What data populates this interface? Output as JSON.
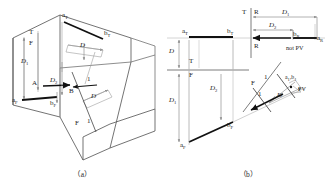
{
  "figure": {
    "title_implicit": "Auxiliary view construction of an oblique line",
    "captions": {
      "a": "（a）",
      "b": "（b）"
    }
  },
  "colors": {
    "solid_outline": "#5a5a5a",
    "thin_construction": "#9a9a9a",
    "heavy_line": "#111111",
    "fold_line": "#6e6e6e",
    "dim_arrow": "#8a8a8a",
    "text": "#1c1c1c"
  },
  "fig_a": {
    "caption": "（a）",
    "description": "Isometric pictorial of a wedge block showing point A and B, the top (T), front (F) and auxiliary (1) viewing directions with transfer distances D, D1 and D2.",
    "labels": [
      {
        "name": "a-top",
        "text": "a",
        "sub": "T",
        "italic": false,
        "x": 62,
        "y": 16
      },
      {
        "name": "b-top",
        "text": "b",
        "sub": "T",
        "italic": false,
        "x": 104,
        "y": 33
      },
      {
        "name": "a-front",
        "text": "a",
        "sub": "F",
        "italic": false,
        "x": 14,
        "y": 97
      },
      {
        "name": "b-front",
        "text": "b",
        "sub": "F",
        "italic": false,
        "x": 51,
        "y": 99
      },
      {
        "name": "point-A",
        "text": "A",
        "sub": "",
        "italic": false,
        "x": 35,
        "y": 81
      },
      {
        "name": "point-B",
        "text": "B",
        "sub": "",
        "italic": false,
        "x": 71,
        "y": 90
      },
      {
        "name": "view-T",
        "text": "T",
        "sub": "",
        "italic": false,
        "x": 30,
        "y": 32
      },
      {
        "name": "view-F-top",
        "text": "F",
        "sub": "",
        "italic": false,
        "x": 30,
        "y": 43
      },
      {
        "name": "view-F-low",
        "text": "F",
        "sub": "",
        "italic": false,
        "x": 77,
        "y": 122
      },
      {
        "name": "view-1-low",
        "text": "1",
        "sub": "",
        "italic": false,
        "x": 89,
        "y": 122
      },
      {
        "name": "view-1-top",
        "text": "1",
        "sub": "",
        "italic": false,
        "x": 88,
        "y": 78
      },
      {
        "name": "dist-D1",
        "text": "D",
        "sub": "1",
        "italic": true,
        "x": 24,
        "y": 62
      },
      {
        "name": "dist-D2",
        "text": "D",
        "sub": "2",
        "italic": true,
        "x": 53,
        "y": 80
      },
      {
        "name": "dist-D-top",
        "text": "D",
        "sub": "",
        "italic": true,
        "x": 72,
        "y": 48
      },
      {
        "name": "dist-D-aux",
        "text": "D",
        "sub": "",
        "italic": true,
        "x": 92,
        "y": 94
      }
    ]
  },
  "fig_b": {
    "caption": "（b）",
    "description": "Three-view orthographic layout: top view (T), front view (F), right-side view (R) and auxiliary view 1, with point A and B projected; distances D, D1 and D2 transferred.",
    "labels": [
      {
        "name": "fold-T-upper",
        "text": "T",
        "sub": "",
        "italic": false,
        "x": 80,
        "y": 12
      },
      {
        "name": "fold-R-upper",
        "text": "R",
        "sub": "",
        "italic": false,
        "x": 89,
        "y": 12
      },
      {
        "name": "fold-R-lower",
        "text": "R",
        "sub": "",
        "italic": false,
        "x": 89,
        "y": 44
      },
      {
        "name": "dist-D1-top",
        "text": "D",
        "sub": "1",
        "italic": true,
        "x": 122,
        "y": 14
      },
      {
        "name": "dist-D2-top",
        "text": "D",
        "sub": "2",
        "italic": true,
        "x": 110,
        "y": 27
      },
      {
        "name": "b-right",
        "text": "b",
        "sub": "R",
        "italic": false,
        "x": 128,
        "y": 33
      },
      {
        "name": "a-right",
        "text": "a",
        "sub": "R",
        "italic": false,
        "x": 152,
        "y": 37
      },
      {
        "name": "not-pv",
        "text": "not PV",
        "sub": "",
        "italic": false,
        "x": 123,
        "y": 47
      },
      {
        "name": "a-top",
        "text": "a",
        "sub": "T",
        "italic": false,
        "x": 17,
        "y": 31
      },
      {
        "name": "b-top",
        "text": "b",
        "sub": "T",
        "italic": false,
        "x": 62,
        "y": 31
      },
      {
        "name": "dist-D-left",
        "text": "D",
        "sub": "",
        "italic": true,
        "x": 5,
        "y": 55
      },
      {
        "name": "fold-T-left",
        "text": "T",
        "sub": "",
        "italic": false,
        "x": 25,
        "y": 62
      },
      {
        "name": "fold-F-left",
        "text": "F",
        "sub": "",
        "italic": false,
        "x": 25,
        "y": 78
      },
      {
        "name": "dist-D1-left",
        "text": "D",
        "sub": "1",
        "italic": true,
        "x": 5,
        "y": 102
      },
      {
        "name": "dist-D2-mid",
        "text": "D",
        "sub": "2",
        "italic": true,
        "x": 47,
        "y": 90
      },
      {
        "name": "b-front",
        "text": "b",
        "sub": "F",
        "italic": false,
        "x": 62,
        "y": 124
      },
      {
        "name": "a-front",
        "text": "a",
        "sub": "F",
        "italic": false,
        "x": 15,
        "y": 143
      },
      {
        "name": "fold-F-aux",
        "text": "F",
        "sub": "",
        "italic": false,
        "x": 88,
        "y": 83
      },
      {
        "name": "fold-1-aux-up",
        "text": "1",
        "sub": "",
        "italic": false,
        "x": 100,
        "y": 78
      },
      {
        "name": "fold-1-aux-lo",
        "text": "1",
        "sub": "",
        "italic": false,
        "x": 94,
        "y": 95
      },
      {
        "name": "ab-aux",
        "text": "a₁,b₁",
        "sub": "",
        "italic": false,
        "x": 124,
        "y": 80
      },
      {
        "name": "pv",
        "text": "PV",
        "sub": "",
        "italic": false,
        "x": 133,
        "y": 90
      },
      {
        "name": "dist-D-aux",
        "text": "D",
        "sub": "",
        "italic": true,
        "x": 113,
        "y": 94
      }
    ]
  }
}
